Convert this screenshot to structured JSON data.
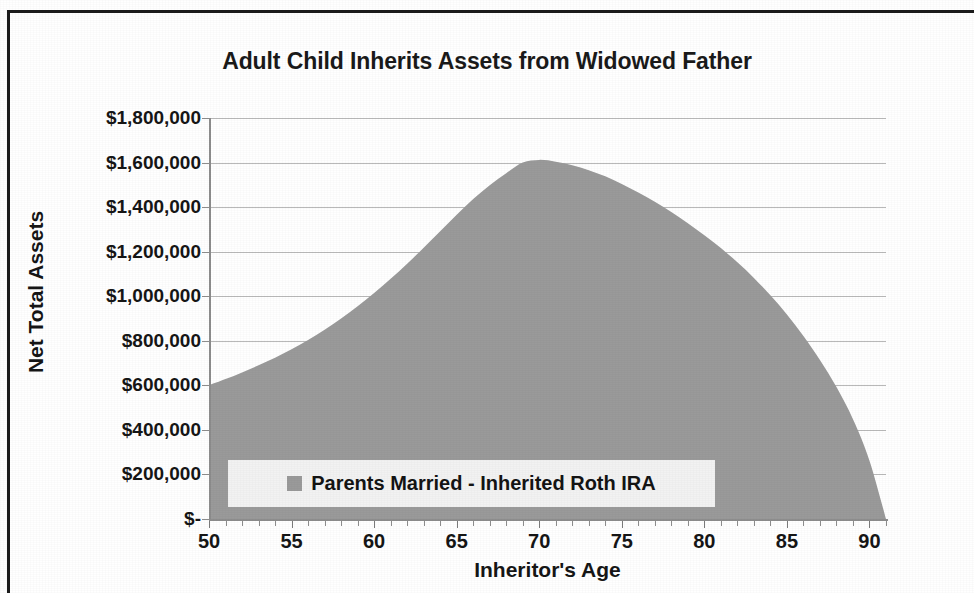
{
  "chart_data": {
    "type": "area",
    "title": "Adult Child Inherits Assets from Widowed Father",
    "xlabel": "Inheritor's Age",
    "ylabel": "Net Total Assets",
    "xlim": [
      50,
      91
    ],
    "ylim": [
      0,
      1800000
    ],
    "grid": true,
    "legend_position": "inside-bottom-center",
    "fill_color": "#9a9a9a",
    "gridline_color": "#b9b9b9",
    "axis_color": "#8d8d8d",
    "text_color": "#161616",
    "legend_background": "#f2f2f2",
    "frame_color": "#1c1c1c",
    "x_tick_labels": [
      "50",
      "55",
      "60",
      "65",
      "70",
      "75",
      "80",
      "85",
      "90"
    ],
    "x_tick_values": [
      50,
      55,
      60,
      65,
      70,
      75,
      80,
      85,
      90
    ],
    "x_minor_tick_step": 1,
    "y_tick_labels": [
      "$1,800,000",
      "$1,600,000",
      "$1,400,000",
      "$1,200,000",
      "$1,000,000",
      "$800,000",
      "$600,000",
      "$400,000",
      "$200,000",
      "$-"
    ],
    "y_tick_values": [
      1800000,
      1600000,
      1400000,
      1200000,
      1000000,
      800000,
      600000,
      400000,
      200000,
      0
    ],
    "series": [
      {
        "name": "Parents Married - Inherited Roth IRA",
        "color": "#9a9a9a",
        "x": [
          50,
          51,
          52,
          53,
          54,
          55,
          56,
          57,
          58,
          59,
          60,
          61,
          62,
          63,
          64,
          65,
          66,
          67,
          68,
          69,
          70,
          71,
          72,
          73,
          74,
          75,
          76,
          77,
          78,
          79,
          80,
          81,
          82,
          83,
          84,
          85,
          86,
          87,
          88,
          89,
          90,
          91
        ],
        "values": [
          600000,
          628000,
          658000,
          690000,
          724000,
          762000,
          804000,
          850000,
          900000,
          955000,
          1014000,
          1078000,
          1146000,
          1218000,
          1292000,
          1366000,
          1436000,
          1498000,
          1552000,
          1600000,
          1612000,
          1604000,
          1588000,
          1566000,
          1538000,
          1504000,
          1466000,
          1424000,
          1378000,
          1328000,
          1274000,
          1216000,
          1152000,
          1082000,
          1004000,
          918000,
          822000,
          714000,
          592000,
          448000,
          262000,
          0
        ]
      }
    ]
  },
  "legend": {
    "entries": [
      {
        "label": "Parents Married - Inherited Roth IRA",
        "swatch_color": "#9a9a9a"
      }
    ]
  }
}
